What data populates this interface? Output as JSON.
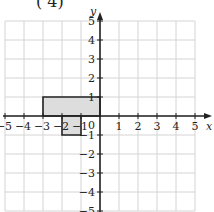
{
  "header_fragment": "( 4)",
  "chart_data": {
    "type": "coordinate-grid",
    "xlabel": "x",
    "ylabel": "y",
    "xlim": [
      -5,
      5
    ],
    "ylim": [
      -5,
      5
    ],
    "grid": true,
    "x_ticks": [
      "-5",
      "-4",
      "-3",
      "-2",
      "-1",
      "1",
      "2",
      "3",
      "4",
      "5"
    ],
    "y_ticks": [
      "5",
      "4",
      "3",
      "2",
      "1",
      "-1",
      "-2",
      "-3",
      "-4",
      "-5"
    ],
    "origin_label": "0",
    "shapes": [
      {
        "name": "rectangle-1",
        "vertices": [
          [
            -3,
            0
          ],
          [
            0,
            0
          ],
          [
            0,
            1
          ],
          [
            -3,
            1
          ]
        ],
        "fill": "#dddddd",
        "stroke": "#222222"
      },
      {
        "name": "rectangle-2",
        "vertices": [
          [
            -2,
            -1
          ],
          [
            -1,
            -1
          ],
          [
            -1,
            0
          ],
          [
            -2,
            0
          ]
        ],
        "fill": "#dddddd",
        "stroke": "#222222"
      }
    ]
  },
  "colors": {
    "grid": "#d4d4d4",
    "axis": "#222222",
    "shape_fill": "#dddddd"
  }
}
